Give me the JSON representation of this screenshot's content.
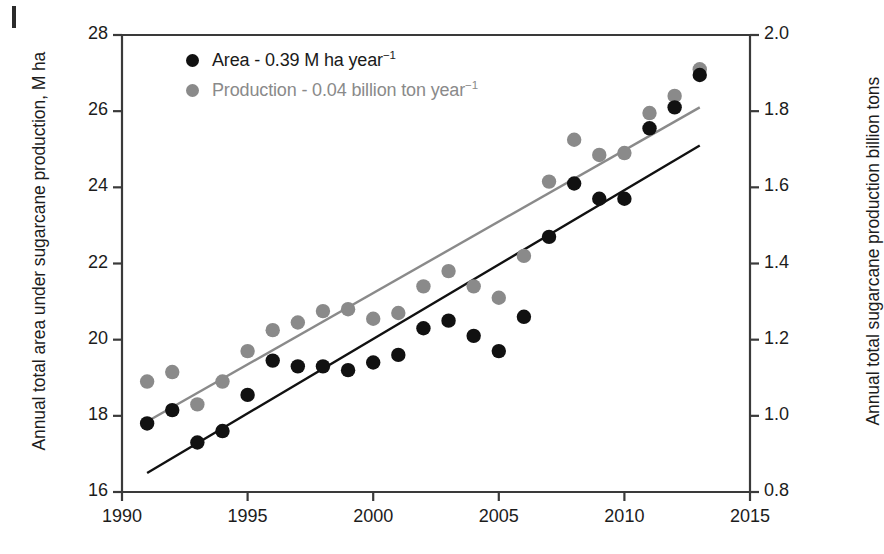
{
  "chart_data": {
    "type": "scatter",
    "title": "",
    "xlabel": "",
    "ylabel": "Annual total area under sugarcane production, M ha",
    "ylabel_right": "Annual total sugarcane production billion tons",
    "xlim": [
      1990,
      2015
    ],
    "ylim": [
      16,
      28
    ],
    "ylim_right": [
      0.8,
      2.0
    ],
    "xticks": [
      "1990",
      "1995",
      "2000",
      "2005",
      "2010",
      "2015"
    ],
    "xtick_values": [
      1990,
      1995,
      2000,
      2005,
      2010,
      2015
    ],
    "yticks_left": [
      "16",
      "18",
      "20",
      "22",
      "24",
      "26",
      "28"
    ],
    "ytick_left_values": [
      16,
      18,
      20,
      22,
      24,
      26,
      28
    ],
    "yticks_right": [
      "0.8",
      "1.0",
      "1.2",
      "1.4",
      "1.6",
      "1.8",
      "2.0"
    ],
    "ytick_right_values": [
      0.8,
      1.0,
      1.2,
      1.4,
      1.6,
      1.8,
      2.0
    ],
    "grid": false,
    "legend_position": "upper-left",
    "x": [
      1991,
      1992,
      1993,
      1994,
      1995,
      1996,
      1997,
      1998,
      1999,
      2000,
      2001,
      2002,
      2003,
      2004,
      2005,
      2006,
      2007,
      2008,
      2009,
      2010,
      2011,
      2012,
      2013
    ],
    "series": [
      {
        "name": "Area - 0.39 M ha year⁻¹",
        "short_name": "Area",
        "axis": "left",
        "unit": "M ha",
        "slope_label": "0.39 M ha year-1",
        "color": "#111111",
        "values": [
          17.8,
          18.15,
          17.3,
          17.6,
          18.55,
          19.45,
          19.3,
          19.3,
          19.2,
          19.4,
          19.6,
          20.3,
          20.5,
          20.1,
          19.7,
          20.6,
          22.7,
          24.1,
          23.7,
          23.7,
          25.55,
          26.1,
          26.95
        ],
        "trend": {
          "x": [
            1991,
            2013
          ],
          "y": [
            16.5,
            25.1
          ]
        }
      },
      {
        "name": "Production - 0.04 billion ton year⁻¹",
        "short_name": "Production",
        "axis": "right",
        "unit": "billion tons",
        "slope_label": "0.04 billion ton year-1",
        "color": "#8a8a8a",
        "values_right_axis": [
          1.09,
          1.12,
          1.03,
          1.09,
          1.17,
          1.23,
          1.25,
          1.28,
          1.28,
          1.25,
          1.27,
          1.34,
          1.38,
          1.33,
          1.31,
          1.42,
          1.61,
          1.73,
          1.7,
          1.7,
          1.8,
          1.84,
          1.91
        ],
        "values_left_equiv": [
          18.9,
          19.15,
          18.3,
          18.9,
          19.7,
          20.25,
          20.45,
          20.75,
          20.8,
          20.55,
          20.7,
          21.4,
          21.8,
          21.4,
          21.1,
          22.2,
          24.15,
          25.25,
          24.85,
          24.9,
          25.95,
          26.4,
          27.1
        ],
        "trend": {
          "x": [
            1991,
            2013
          ],
          "y": [
            17.85,
            26.1
          ]
        }
      }
    ]
  },
  "legend": {
    "items": [
      {
        "label_main": "Area - 0.39 M ha year",
        "exponent": "−1",
        "color": "#111111"
      },
      {
        "label_main": "Production - 0.04 billion ton year",
        "exponent": "−1",
        "color": "#8a8a8a"
      }
    ]
  },
  "colors": {
    "area_marker": "#111111",
    "production_marker": "#8a8a8a",
    "area_trendline": "#111111",
    "production_trendline": "#8a8a8a",
    "axis": "#3a3a3a",
    "text": "#1c1c1c",
    "background": "#ffffff"
  }
}
